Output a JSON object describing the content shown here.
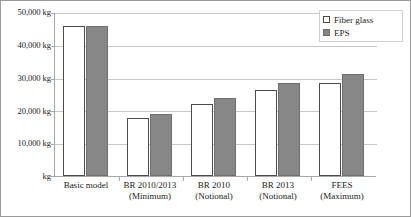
{
  "chart_data": {
    "type": "bar",
    "title": "",
    "xlabel": "",
    "ylabel": "",
    "ylim": [
      0,
      50000
    ],
    "grid": true,
    "legend_position": "top-right",
    "categories": [
      "Basic model",
      "BR 2010/2013",
      "BR 2010",
      "BR 2013",
      "FEES"
    ],
    "category_sublabels": [
      "",
      "(Minimum)",
      "(Notional)",
      "(Notional)",
      "(Maximum)"
    ],
    "ytick_labels": [
      "50,000 kg",
      "40,000 kg",
      "30,000 kg",
      "20,000 kg",
      "10,000 kg",
      "kg"
    ],
    "ytick_values": [
      50000,
      40000,
      30000,
      20000,
      10000,
      0
    ],
    "series": [
      {
        "name": "Fiber glass",
        "color": "#ffffff",
        "border": "#4a4a4a",
        "values": [
          45800,
          17700,
          22100,
          26200,
          28500
        ]
      },
      {
        "name": "EPS",
        "color": "#878787",
        "border": "#6e6e6e",
        "values": [
          45800,
          18900,
          23700,
          28300,
          31100
        ]
      }
    ]
  },
  "legend": {
    "items": [
      {
        "label": "Fiber glass"
      },
      {
        "label": "EPS"
      }
    ]
  }
}
